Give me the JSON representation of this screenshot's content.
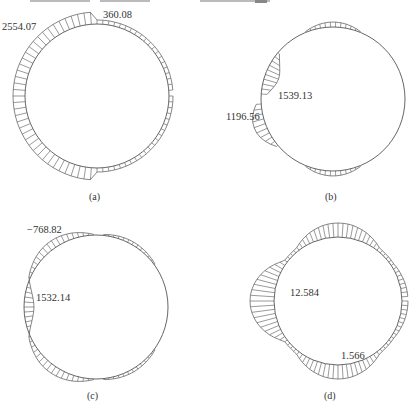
{
  "header_cutoff_text": "",
  "panels": [
    {
      "id": "a",
      "caption": "(a)",
      "labels": {
        "max": "2554.07",
        "min": "360.08"
      },
      "center": [
        97,
        96
      ],
      "radius": 72
    },
    {
      "id": "b",
      "caption": "(b)",
      "labels": {
        "upper": "1539.13",
        "lower": "1196.56"
      },
      "center": [
        333,
        99
      ],
      "radius": 72
    },
    {
      "id": "c",
      "caption": "(c)",
      "labels": {
        "top": "−768.82",
        "left": "1532.14"
      },
      "center": [
        96,
        307
      ],
      "radius": 72
    },
    {
      "id": "d",
      "caption": "(d)",
      "labels": {
        "left": "12.584",
        "lower_right": "1.566"
      },
      "center": [
        338,
        301
      ],
      "radius": 64
    }
  ]
}
